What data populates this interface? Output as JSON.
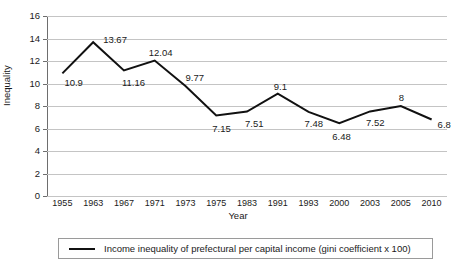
{
  "chart_data": {
    "type": "line",
    "title": "",
    "xlabel": "Year",
    "ylabel": "Inequality",
    "categories": [
      "1955",
      "1963",
      "1967",
      "1971",
      "1973",
      "1975",
      "1983",
      "1991",
      "1993",
      "2000",
      "2003",
      "2005",
      "2010"
    ],
    "values": [
      10.9,
      13.67,
      11.16,
      12.04,
      9.77,
      7.15,
      7.51,
      9.1,
      7.48,
      6.48,
      7.52,
      8,
      6.8
    ],
    "point_labels": [
      "10.9",
      "13.67",
      "11.16",
      "12.04",
      "9.77",
      "7.15",
      "7.51",
      "9.1",
      "7.48",
      "6.48",
      "7.52",
      "8",
      "6.8"
    ],
    "ylim": [
      0,
      16
    ],
    "ytick_labels": [
      "0",
      "2",
      "4",
      "6",
      "8",
      "10",
      "12",
      "14",
      "16"
    ],
    "ytick_values": [
      0,
      2,
      4,
      6,
      8,
      10,
      12,
      14,
      16
    ],
    "grid": true,
    "legend_position": "bottom",
    "series": [
      {
        "name": "Income inequality of prefectural per capital income (gini coefficient x 100)",
        "color": "#111111",
        "values": [
          10.9,
          13.67,
          11.16,
          12.04,
          9.77,
          7.15,
          7.51,
          9.1,
          7.48,
          6.48,
          7.52,
          8,
          6.8
        ]
      }
    ]
  },
  "legend": {
    "entries": [
      {
        "label": "Income inequality of prefectural per capital income (gini coefficient x 100)"
      }
    ]
  },
  "colors": {
    "series_line": "#111111",
    "gridline": "#c4c4c4",
    "axis": "#6e6e6e",
    "text": "#1a1a1a",
    "background": "#ffffff"
  }
}
